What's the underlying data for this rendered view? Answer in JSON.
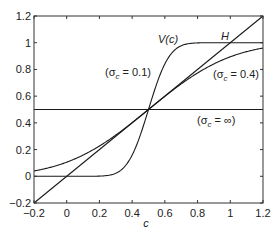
{
  "chart_data": {
    "type": "line",
    "title": "",
    "xlabel": "c",
    "ylabel": "",
    "xlim": [
      -0.2,
      1.2
    ],
    "ylim": [
      -0.2,
      1.2
    ],
    "grid": false,
    "legend": "none (inline annotations)",
    "xticks": [
      -0.2,
      0,
      0.2,
      0.4,
      0.6,
      0.8,
      1,
      1.2
    ],
    "xtick_labels": [
      "-0.2",
      "0",
      "0.2",
      "0.4",
      "0.6",
      "0.8",
      "1",
      "1.2"
    ],
    "yticks": [
      -0.2,
      0,
      0.2,
      0.4,
      0.6,
      0.8,
      1,
      1.2
    ],
    "ytick_labels": [
      "-0.2",
      "0",
      "0.2",
      "0.4",
      "0.6",
      "0.8",
      "1",
      "1.2"
    ],
    "series": [
      {
        "name": "H",
        "kind": "identity",
        "description": "H = c",
        "x": [
          -0.2,
          1.2
        ],
        "y": [
          -0.2,
          1.2
        ]
      },
      {
        "name": "V(c) (σc = 0.1)",
        "kind": "normal_cdf",
        "mean": 0.5,
        "sigma": 0.1,
        "x": [
          -0.2,
          0,
          0.2,
          0.3,
          0.4,
          0.5,
          0.6,
          0.7,
          0.8,
          1.0,
          1.2
        ],
        "y": [
          0.0,
          0.0,
          0.001,
          0.023,
          0.159,
          0.5,
          0.841,
          0.977,
          0.999,
          1.0,
          1.0
        ]
      },
      {
        "name": "(σc = 0.4)",
        "kind": "normal_cdf",
        "mean": 0.5,
        "sigma": 0.4,
        "x": [
          -0.2,
          0,
          0.2,
          0.4,
          0.5,
          0.6,
          0.8,
          1.0,
          1.2
        ],
        "y": [
          0.04,
          0.106,
          0.227,
          0.401,
          0.5,
          0.599,
          0.773,
          0.894,
          0.96
        ]
      },
      {
        "name": "(σc = ∞)",
        "kind": "constant",
        "x": [
          -0.2,
          1.2
        ],
        "y": [
          0.5,
          0.5
        ]
      }
    ],
    "annotations": [
      {
        "text": "V(c)",
        "x": 0.53,
        "y": 0.9
      },
      {
        "text": "H",
        "x": 0.97,
        "y": 1.03
      },
      {
        "text": "(σc = 0.1)",
        "x": 0.2,
        "y": 0.77
      },
      {
        "text": "(σc = 0.4)",
        "x": 0.93,
        "y": 0.8
      },
      {
        "text": "(σc = ∞)",
        "x": 0.92,
        "y": 0.42
      }
    ]
  },
  "labels": {
    "xlabel": "c",
    "v_label": "V(c)",
    "h_label": "H",
    "sigma01_prefix": "(σ",
    "sigma01_suffix": " = 0.1)",
    "sigma04_prefix": "(σ",
    "sigma04_suffix": " = 0.4)",
    "sigmainf_prefix": "(σ",
    "sigmainf_suffix": " = ∞)",
    "sub": "c"
  },
  "colors": {
    "line": "#1a1a1a",
    "axis": "#333333",
    "text": "#222222"
  }
}
